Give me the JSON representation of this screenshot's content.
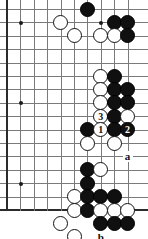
{
  "figure": {
    "kind": "go-board-diagram",
    "board_size": 19,
    "visible_region": "lower-right portion of board, right and bottom edges shown",
    "columns_visible": 10,
    "rows_visible": 16,
    "cell_px": 13.4,
    "origin_x_px": 7,
    "origin_y_px": 9,
    "colors": {
      "background": "#ffffff",
      "grid_line": "#7a7a7a",
      "border_line": "#2b2b2b",
      "black_stone": "#101010",
      "white_stone": "#ffffff",
      "stone_outline": "#111111",
      "label_text": "#111111"
    }
  },
  "star_points": [
    {
      "col": 2,
      "row": 2,
      "name": "hoshi-upper"
    },
    {
      "col": 2,
      "row": 8,
      "name": "hoshi-middle"
    },
    {
      "col": 2,
      "row": 14,
      "name": "hoshi-lower"
    },
    {
      "col": 8,
      "row": 2,
      "name": "hoshi-right-upper"
    }
  ],
  "stones": [
    {
      "id": "w1",
      "color": "white",
      "col": 5,
      "row": 2,
      "label": ""
    },
    {
      "id": "b1",
      "color": "black",
      "col": 7,
      "row": 1,
      "label": ""
    },
    {
      "id": "b2",
      "color": "black",
      "col": 9,
      "row": 2,
      "label": ""
    },
    {
      "id": "b3",
      "color": "black",
      "col": 10,
      "row": 2,
      "label": ""
    },
    {
      "id": "w2",
      "color": "white",
      "col": 6,
      "row": 3,
      "label": ""
    },
    {
      "id": "w3",
      "color": "white",
      "col": 8,
      "row": 3,
      "label": ""
    },
    {
      "id": "w4",
      "color": "white",
      "col": 9,
      "row": 3,
      "label": ""
    },
    {
      "id": "b4",
      "color": "black",
      "col": 10,
      "row": 3,
      "label": ""
    },
    {
      "id": "w5",
      "color": "white",
      "col": 8,
      "row": 6,
      "label": ""
    },
    {
      "id": "b5",
      "color": "black",
      "col": 9,
      "row": 6,
      "label": ""
    },
    {
      "id": "w6",
      "color": "white",
      "col": 8,
      "row": 7,
      "label": ""
    },
    {
      "id": "b6",
      "color": "black",
      "col": 9,
      "row": 7,
      "label": ""
    },
    {
      "id": "b7",
      "color": "black",
      "col": 10,
      "row": 7,
      "label": ""
    },
    {
      "id": "w7",
      "color": "white",
      "col": 8,
      "row": 8,
      "label": ""
    },
    {
      "id": "b8",
      "color": "black",
      "col": 9,
      "row": 8,
      "label": ""
    },
    {
      "id": "b9",
      "color": "black",
      "col": 10,
      "row": 8,
      "label": ""
    },
    {
      "id": "w8",
      "color": "white",
      "col": 8,
      "row": 9,
      "label": "3"
    },
    {
      "id": "b10",
      "color": "black",
      "col": 9,
      "row": 9,
      "label": ""
    },
    {
      "id": "w9",
      "color": "white",
      "col": 10,
      "row": 9,
      "label": ""
    },
    {
      "id": "b11",
      "color": "black",
      "col": 7,
      "row": 10,
      "label": ""
    },
    {
      "id": "w10",
      "color": "white",
      "col": 8,
      "row": 10,
      "label": "1"
    },
    {
      "id": "b12",
      "color": "black",
      "col": 9,
      "row": 10,
      "label": ""
    },
    {
      "id": "b13",
      "color": "black",
      "col": 10,
      "row": 10,
      "label": "2"
    },
    {
      "id": "w11",
      "color": "white",
      "col": 7,
      "row": 11,
      "label": ""
    },
    {
      "id": "w12",
      "color": "white",
      "col": 9,
      "row": 11,
      "label": ""
    },
    {
      "id": "b14",
      "color": "black",
      "col": 7,
      "row": 13,
      "label": ""
    },
    {
      "id": "w13",
      "color": "white",
      "col": 8,
      "row": 13,
      "label": ""
    },
    {
      "id": "b15",
      "color": "black",
      "col": 7,
      "row": 14,
      "label": ""
    },
    {
      "id": "w14",
      "color": "white",
      "col": 6,
      "row": 15,
      "label": ""
    },
    {
      "id": "b16",
      "color": "black",
      "col": 7,
      "row": 15,
      "label": ""
    },
    {
      "id": "b17",
      "color": "black",
      "col": 8,
      "row": 15,
      "label": ""
    },
    {
      "id": "b18",
      "color": "black",
      "col": 9,
      "row": 15,
      "label": ""
    },
    {
      "id": "w15",
      "color": "white",
      "col": 6,
      "row": 16,
      "label": ""
    },
    {
      "id": "b19",
      "color": "black",
      "col": 7,
      "row": 16,
      "label": ""
    },
    {
      "id": "w16",
      "color": "white",
      "col": 8,
      "row": 16,
      "label": ""
    },
    {
      "id": "w17",
      "color": "white",
      "col": 9,
      "row": 16,
      "label": ""
    },
    {
      "id": "w18",
      "color": "white",
      "col": 10,
      "row": 16,
      "label": ""
    },
    {
      "id": "w19",
      "color": "white",
      "col": 5,
      "row": 17,
      "label": ""
    },
    {
      "id": "b20",
      "color": "black",
      "col": 8,
      "row": 17,
      "label": ""
    },
    {
      "id": "b21",
      "color": "black",
      "col": 9,
      "row": 17,
      "label": ""
    },
    {
      "id": "b22",
      "color": "black",
      "col": 10,
      "row": 17,
      "label": ""
    },
    {
      "id": "w20",
      "color": "white",
      "col": 6,
      "row": 18,
      "label": ""
    }
  ],
  "point_labels": [
    {
      "id": "la",
      "text": "a",
      "col": 10,
      "row": 12
    },
    {
      "id": "lb",
      "text": "b",
      "col": 8,
      "row": 18
    }
  ],
  "move_sequence": [
    {
      "number": "1",
      "color": "white",
      "stone_id": "w10"
    },
    {
      "number": "2",
      "color": "black",
      "stone_id": "b13"
    },
    {
      "number": "3",
      "color": "white",
      "stone_id": "w8"
    }
  ]
}
